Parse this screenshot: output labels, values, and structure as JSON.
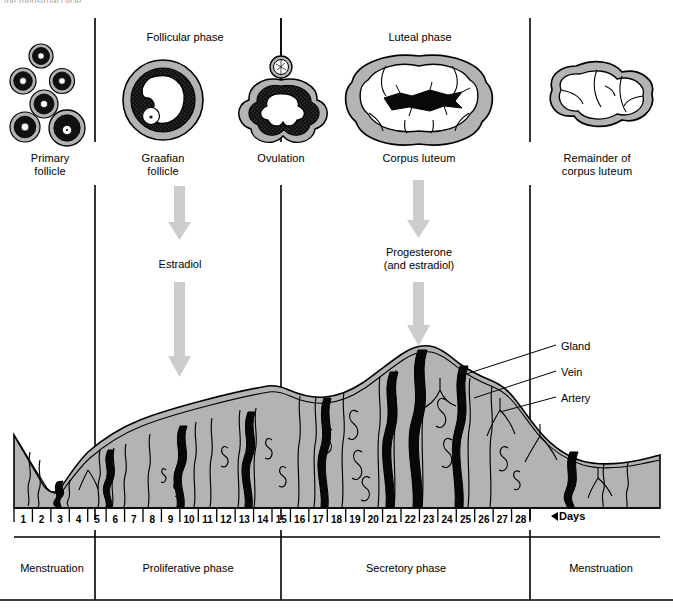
{
  "figure": {
    "clipped_caption": "the menstrual cycle.",
    "background": "#ffffff",
    "ink": "#000000",
    "tissue_gray": "#b3b3b3",
    "arrow_gray": "#cccccc"
  },
  "phase_headers": [
    {
      "label": "Follicular phase",
      "x": 185,
      "y": 31
    },
    {
      "label": "Luteal phase",
      "x": 420,
      "y": 31
    }
  ],
  "ovary_structures": [
    {
      "name": "primary-follicle",
      "label": "Primary\nfollicle",
      "label_x": 50,
      "label_y": 152
    },
    {
      "name": "graafian-follicle",
      "label": "Graafian\nfollicle",
      "label_x": 163,
      "label_y": 152
    },
    {
      "name": "ovulation",
      "label": "Ovulation",
      "label_x": 281,
      "label_y": 152
    },
    {
      "name": "corpus-luteum",
      "label": "Corpus luteum",
      "label_x": 419,
      "label_y": 152
    },
    {
      "name": "remainder-corpus-luteum",
      "label": "Remainder of\ncorpus luteum",
      "label_x": 597,
      "label_y": 152
    }
  ],
  "hormones": [
    {
      "name": "estradiol",
      "label": "Estradiol",
      "x": 180,
      "y": 258
    },
    {
      "name": "progesterone",
      "label": "Progesterone\n(and estradiol)",
      "x": 419,
      "y": 252
    }
  ],
  "endometrium_callouts": [
    {
      "label": "Gland",
      "x": 563,
      "y": 346
    },
    {
      "label": "Vein",
      "x": 563,
      "y": 372
    },
    {
      "label": "Artery",
      "x": 563,
      "y": 398
    }
  ],
  "axis": {
    "days_label": "Days",
    "days": [
      1,
      2,
      3,
      4,
      5,
      6,
      7,
      8,
      9,
      10,
      11,
      12,
      13,
      14,
      15,
      16,
      17,
      18,
      19,
      20,
      21,
      22,
      23,
      24,
      25,
      26,
      27,
      28
    ]
  },
  "cycle_phases": [
    {
      "label": "Menstruation",
      "x": 52,
      "y": 568
    },
    {
      "label": "Proliferative phase",
      "x": 188,
      "y": 568
    },
    {
      "label": "Secretory phase",
      "x": 406,
      "y": 568
    },
    {
      "label": "Menstruation",
      "x": 601,
      "y": 568
    }
  ],
  "chart_data": {
    "type": "area",
    "xlabel": "Days",
    "ylabel": "Endometrial thickness",
    "x": [
      1,
      2,
      3,
      4,
      5,
      6,
      7,
      8,
      9,
      10,
      11,
      12,
      13,
      14,
      15,
      16,
      17,
      18,
      19,
      20,
      21,
      22,
      23,
      24,
      25,
      26,
      27,
      28
    ],
    "values": [
      38,
      28,
      18,
      12,
      14,
      18,
      24,
      30,
      36,
      42,
      47,
      52,
      57,
      60,
      62,
      66,
      70,
      74,
      80,
      88,
      96,
      104,
      112,
      118,
      104,
      86,
      62,
      40
    ],
    "ylim": [
      0,
      125
    ],
    "grid": false,
    "legend": null,
    "annotations": [
      "Gland",
      "Vein",
      "Artery"
    ]
  }
}
